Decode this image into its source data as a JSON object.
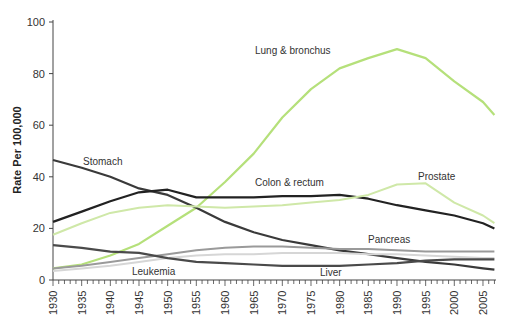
{
  "chart_data": {
    "type": "line",
    "title": "",
    "xlabel": "",
    "ylabel": "Rate Per 100,000",
    "xlim": [
      1930,
      2007
    ],
    "ylim": [
      0,
      100
    ],
    "y_ticks": [
      0,
      20,
      40,
      60,
      80,
      100
    ],
    "x_ticks": [
      1930,
      1935,
      1940,
      1945,
      1950,
      1955,
      1960,
      1965,
      1970,
      1975,
      1980,
      1985,
      1990,
      1995,
      2000,
      2005
    ],
    "grid": false,
    "legend": "inline labels",
    "x": [
      1930,
      1935,
      1940,
      1945,
      1950,
      1955,
      1960,
      1965,
      1970,
      1975,
      1980,
      1985,
      1990,
      1995,
      2000,
      2005,
      2007
    ],
    "series": [
      {
        "name": "Lung & bronchus",
        "color": "#b5e07a",
        "width": 2.2,
        "values": [
          4.5,
          6,
          9.5,
          14,
          21,
          28,
          38,
          49,
          63,
          74,
          82,
          86,
          89.5,
          86,
          77,
          69,
          64
        ],
        "label_pos": [
          255,
          54
        ]
      },
      {
        "name": "Stomach",
        "color": "#3a3a3a",
        "width": 2.2,
        "values": [
          46.5,
          43.5,
          40,
          35.5,
          33,
          28,
          22.5,
          18.5,
          15.5,
          13.5,
          11.5,
          10,
          8.5,
          7,
          6,
          4.5,
          4
        ],
        "label_pos": [
          83,
          165
        ]
      },
      {
        "name": "Colon & rectum",
        "color": "#222222",
        "width": 2.2,
        "values": [
          22.5,
          26.5,
          30.5,
          34,
          35,
          32,
          32,
          32,
          32.5,
          32.5,
          33,
          31.5,
          29,
          27,
          25,
          22,
          20
        ],
        "label_pos": [
          255,
          186
        ]
      },
      {
        "name": "Prostate",
        "color": "#cfe8a8",
        "width": 2,
        "values": [
          17.5,
          22,
          26,
          28,
          29,
          28.5,
          28,
          28.5,
          29,
          30,
          31,
          33,
          37,
          37.5,
          30,
          25,
          22
        ],
        "label_pos": [
          418,
          180
        ]
      },
      {
        "name": "Pancreas",
        "color": "#9a9a9a",
        "width": 2,
        "values": [
          4.5,
          5.5,
          7,
          8.5,
          10,
          11.5,
          12.5,
          13,
          13,
          12.5,
          12,
          12,
          11.5,
          11,
          11,
          11,
          11
        ],
        "label_pos": [
          368,
          243
        ]
      },
      {
        "name": "Leukemia",
        "color": "#d6d6d6",
        "width": 2,
        "values": [
          3.5,
          4.5,
          5.5,
          7,
          8.5,
          9.5,
          10,
          10,
          10.5,
          10.5,
          10.5,
          10,
          10,
          9.5,
          9,
          8.5,
          8.5
        ],
        "label_pos": [
          132,
          275
        ]
      },
      {
        "name": "Liver",
        "color": "#4a4a4a",
        "width": 2.2,
        "values": [
          13.5,
          12.5,
          11,
          10.5,
          8.5,
          7,
          6.5,
          6,
          5.5,
          5.5,
          5.5,
          6,
          6.5,
          7.5,
          8,
          8,
          8
        ],
        "label_pos": [
          320,
          276
        ]
      }
    ]
  }
}
